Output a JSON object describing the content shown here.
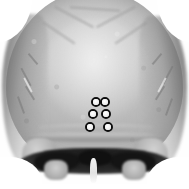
{
  "image": {
    "kind": "medical-image",
    "modality_label": "3D CT surface reconstruction",
    "view_label": "Posterior skull (occipital) view",
    "palette": "grayscale",
    "width": 189,
    "height": 189,
    "background_color": "#ffffff",
    "bone_color": "#c6c6c6",
    "shadow_color": "#141414",
    "marker_outline_color": "#0d0d0d",
    "marker_fill_color": "#f2f2f2"
  },
  "anatomy": {
    "regions": [
      {
        "name": "cranial-vault",
        "label": "Cranial vault"
      },
      {
        "name": "occipital-bone",
        "label": "Occipital bone"
      },
      {
        "name": "lambdoid-suture",
        "label": "Lambdoid suture"
      },
      {
        "name": "superior-nuchal-line",
        "label": "Superior nuchal line"
      },
      {
        "name": "mastoid-process-left",
        "label": "Left mastoid process"
      },
      {
        "name": "mastoid-process-right",
        "label": "Right mastoid process"
      },
      {
        "name": "skull-base-shadow",
        "label": "Skull base shadow"
      },
      {
        "name": "midline-septum",
        "label": "Midline septum"
      }
    ]
  },
  "markers": {
    "count": 6,
    "shape": "circle",
    "diameter_px": 10,
    "items": [
      {
        "id": "1",
        "label": "Marker 1",
        "row": "top",
        "side": "left",
        "x": 96,
        "y": 102,
        "d": 10
      },
      {
        "id": "2",
        "label": "Marker 2",
        "row": "top",
        "side": "right",
        "x": 105,
        "y": 102,
        "d": 10
      },
      {
        "id": "3",
        "label": "Marker 3",
        "row": "middle",
        "side": "left",
        "x": 93,
        "y": 114,
        "d": 10
      },
      {
        "id": "4",
        "label": "Marker 4",
        "row": "middle",
        "side": "right",
        "x": 106,
        "y": 114,
        "d": 10
      },
      {
        "id": "5",
        "label": "Marker 5",
        "row": "bottom",
        "side": "left",
        "x": 90,
        "y": 127,
        "d": 10
      },
      {
        "id": "6",
        "label": "Marker 6",
        "row": "bottom",
        "side": "right",
        "x": 108,
        "y": 127,
        "d": 10
      }
    ]
  }
}
